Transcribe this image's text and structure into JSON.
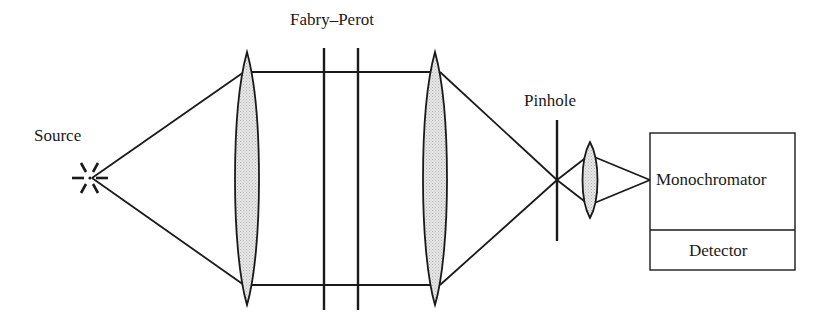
{
  "diagram": {
    "type": "optical-setup",
    "components": [
      {
        "id": "source",
        "label": "Source"
      },
      {
        "id": "collimating-lens",
        "label": ""
      },
      {
        "id": "fabry-perot",
        "label": "Fabry–Perot"
      },
      {
        "id": "focusing-lens",
        "label": ""
      },
      {
        "id": "pinhole",
        "label": "Pinhole"
      },
      {
        "id": "relay-lens",
        "label": ""
      },
      {
        "id": "monochromator",
        "label": "Monochromator"
      },
      {
        "id": "detector",
        "label": "Detector"
      }
    ],
    "colors": {
      "stroke": "#1a1a1a",
      "lens_fill": "#d9d9d9",
      "background": "#ffffff"
    }
  },
  "labels": {
    "source": "Source",
    "fabry_perot": "Fabry–Perot",
    "pinhole": "Pinhole",
    "monochromator": "Monochromator",
    "detector": "Detector"
  }
}
